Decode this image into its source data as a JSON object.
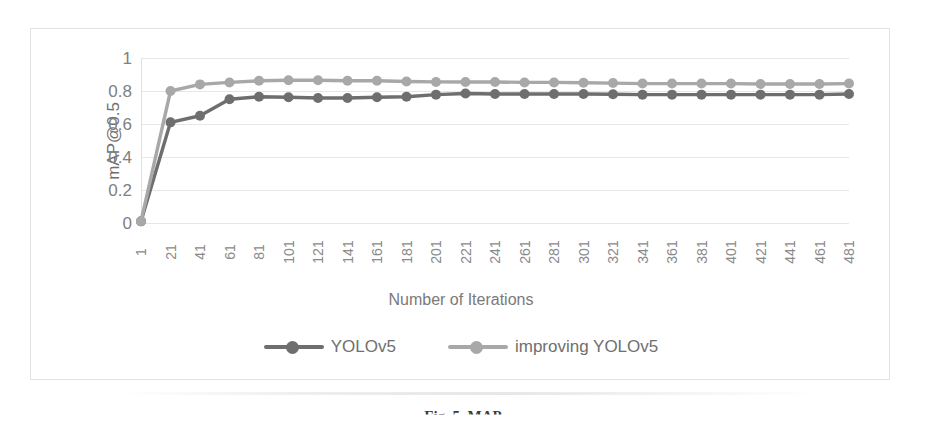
{
  "figure": {
    "caption": "Fig. 5. MAP",
    "border_color": "#e2e2e2"
  },
  "chart_data": {
    "type": "line",
    "title": "",
    "xlabel": "Number of Iterations",
    "ylabel": "mAP@0.5",
    "xlim": [
      1,
      481
    ],
    "ylim": [
      0,
      1
    ],
    "yticks": [
      "0",
      "0.2",
      "0.4",
      "0.6",
      "0.8",
      "1"
    ],
    "ytick_values": [
      0,
      0.2,
      0.4,
      0.6,
      0.8,
      1
    ],
    "grid": "horizontal",
    "legend_position": "bottom-center",
    "marker": "circle",
    "categories": [
      1,
      21,
      41,
      61,
      81,
      101,
      121,
      141,
      161,
      181,
      201,
      221,
      241,
      261,
      281,
      301,
      321,
      341,
      361,
      381,
      401,
      421,
      441,
      461,
      481
    ],
    "series": [
      {
        "name": "YOLOv5",
        "color": "#6e6e6e",
        "values": [
          0.01,
          0.61,
          0.65,
          0.75,
          0.765,
          0.762,
          0.758,
          0.758,
          0.762,
          0.765,
          0.778,
          0.785,
          0.782,
          0.782,
          0.782,
          0.782,
          0.78,
          0.778,
          0.778,
          0.778,
          0.778,
          0.778,
          0.778,
          0.778,
          0.782
        ]
      },
      {
        "name": "improving YOLOv5",
        "color": "#a8a8a8",
        "values": [
          0.01,
          0.8,
          0.84,
          0.852,
          0.862,
          0.865,
          0.865,
          0.862,
          0.862,
          0.858,
          0.855,
          0.855,
          0.855,
          0.852,
          0.852,
          0.85,
          0.848,
          0.845,
          0.845,
          0.845,
          0.845,
          0.842,
          0.842,
          0.842,
          0.845
        ]
      }
    ]
  }
}
